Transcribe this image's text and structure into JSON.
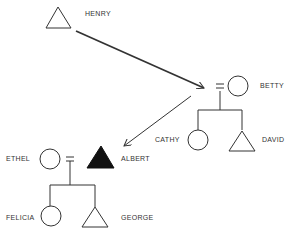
{
  "diagram": {
    "type": "pedigree",
    "colors": {
      "stroke": "#333333",
      "affected_fill": "#111111",
      "background": "#ffffff"
    },
    "people": [
      {
        "id": "henry",
        "name": "HENRY",
        "sex": "male",
        "shape": "triangle",
        "affected": false
      },
      {
        "id": "betty",
        "name": "BETTY",
        "sex": "female",
        "shape": "circle",
        "affected": false
      },
      {
        "id": "cathy",
        "name": "CATHY",
        "sex": "female",
        "shape": "circle",
        "affected": false
      },
      {
        "id": "david",
        "name": "DAVID",
        "sex": "male",
        "shape": "triangle",
        "affected": false
      },
      {
        "id": "ethel",
        "name": "ETHEL",
        "sex": "female",
        "shape": "circle",
        "affected": false
      },
      {
        "id": "albert",
        "name": "ALBERT",
        "sex": "male",
        "shape": "triangle",
        "affected": true
      },
      {
        "id": "felicia",
        "name": "FELICIA",
        "sex": "female",
        "shape": "circle",
        "affected": false
      },
      {
        "id": "george",
        "name": "GEORGE",
        "sex": "male",
        "shape": "triangle",
        "affected": false
      }
    ],
    "unions": [
      {
        "partners": [
          "henry",
          "betty"
        ],
        "symbol": "=",
        "children": [
          "cathy",
          "david"
        ]
      },
      {
        "partners": [
          "ethel",
          "albert"
        ],
        "symbol": "=",
        "children": [
          "felicia",
          "george"
        ]
      }
    ],
    "arrows": [
      {
        "from": "henry",
        "to": "betty-union"
      },
      {
        "from": "betty-union",
        "to": "albert"
      }
    ]
  }
}
